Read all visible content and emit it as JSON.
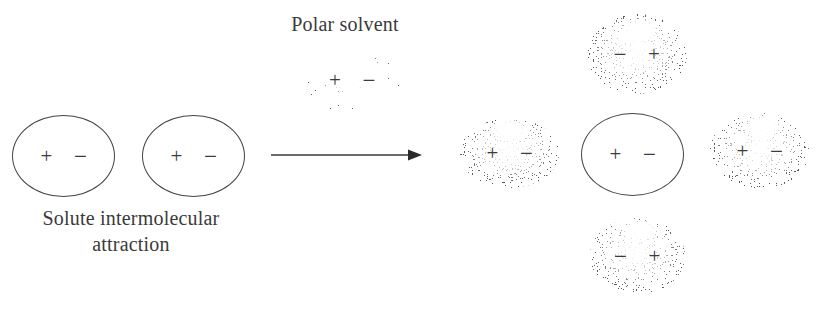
{
  "figure": {
    "width": 823,
    "height": 320,
    "background": "#ffffff",
    "stroke_color": "#44444a",
    "text_color": "#3a3a3a",
    "stipple_color": "#1d1d1d"
  },
  "labels": {
    "polar_solvent": "Polar solvent",
    "solute_attraction": "Solute intermolecular\nattraction"
  },
  "arrow": {
    "name": "reaction-arrow",
    "direction": "right"
  },
  "charges": {
    "plus": "+",
    "minus": "−"
  },
  "left_side": {
    "caption": "Solute intermolecular\nattraction",
    "molecules": [
      {
        "id": "solute-left-1",
        "type": "solute",
        "left_charge": "+",
        "right_charge": "−",
        "x": 12,
        "y": 115,
        "w": 103,
        "h": 82
      },
      {
        "id": "solute-left-2",
        "type": "solute",
        "left_charge": "+",
        "right_charge": "−",
        "x": 142,
        "y": 115,
        "w": 103,
        "h": 82
      }
    ]
  },
  "middle": {
    "caption": "Polar solvent",
    "molecules": [
      {
        "id": "solvent-legend",
        "type": "solvent",
        "left_charge": "+",
        "right_charge": "−",
        "x": 303,
        "y": 46,
        "w": 98,
        "h": 68
      }
    ]
  },
  "right_side": {
    "molecules": [
      {
        "id": "solvent-top",
        "type": "solvent",
        "left_charge": "−",
        "right_charge": "+",
        "x": 586,
        "y": 13,
        "w": 102,
        "h": 82
      },
      {
        "id": "solvent-left",
        "type": "solvent",
        "left_charge": "+",
        "right_charge": "−",
        "x": 459,
        "y": 117,
        "w": 101,
        "h": 72
      },
      {
        "id": "solute-center",
        "type": "solute",
        "left_charge": "+",
        "right_charge": "−",
        "x": 581,
        "y": 113,
        "w": 103,
        "h": 83
      },
      {
        "id": "solvent-right",
        "type": "solvent",
        "left_charge": "+",
        "right_charge": "−",
        "x": 709,
        "y": 112,
        "w": 101,
        "h": 78
      },
      {
        "id": "solvent-bottom",
        "type": "solvent",
        "left_charge": "−",
        "right_charge": "+",
        "x": 589,
        "y": 217,
        "w": 97,
        "h": 78
      }
    ]
  }
}
